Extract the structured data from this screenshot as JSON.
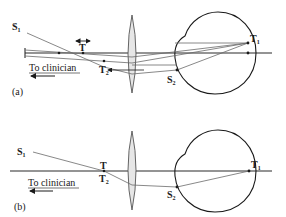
{
  "figure": {
    "panels": [
      {
        "id": "a",
        "panel_label": "(a)",
        "labels": {
          "source_left": "S",
          "source_left_prime_sub": "1",
          "target_mid": "T",
          "target_image2": "T",
          "target_image2_sub": "2",
          "target_image1": "T",
          "target_image1_sub": "1",
          "source_image2": "S",
          "source_image2_sub": "2"
        },
        "direction_text": "To clinician"
      },
      {
        "id": "b",
        "panel_label": "(b)",
        "labels": {
          "source_left": "S",
          "source_left_prime_sub": "1",
          "target_mid": "T",
          "target_image2": "T",
          "target_image2_sub": "2",
          "target_image1": "T",
          "target_image1_sub": "1",
          "source_image2": "S",
          "source_image2_sub": "2"
        },
        "direction_text": "To clinician"
      }
    ],
    "colors": {
      "line": "#2a2a2a",
      "ray": "#6a6a6a",
      "lens_fill": "#e6e6e6"
    }
  }
}
